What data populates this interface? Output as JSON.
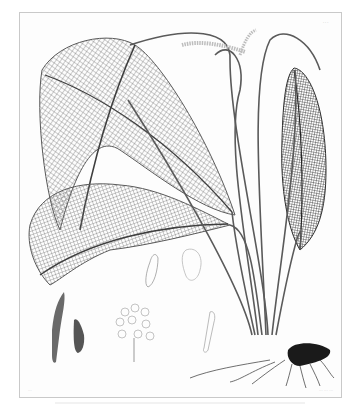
{
  "plate": {
    "type": "botanical engraving",
    "subject": "lattice-leaf aquatic plant with figure details",
    "plate_number": "···",
    "credit_left": "···",
    "credit_right": "··· ··· ···",
    "figures": [
      {
        "id": "leaf-lattice-large",
        "description": "large lattice (fenestrated) leaf, upper left"
      },
      {
        "id": "leaf-lattice-lower",
        "description": "curved lattice leaf, lower left"
      },
      {
        "id": "leaf-dark-right",
        "description": "dark narrow lattice leaf, right"
      },
      {
        "id": "inflorescence",
        "description": "spike inflorescence at top"
      },
      {
        "id": "rhizome",
        "description": "dark rhizome with roots, lower right"
      },
      {
        "id": "fig-spathe",
        "description": "spathe detail, lower left"
      },
      {
        "id": "fig-bract",
        "description": "bract detail, lower left"
      },
      {
        "id": "fig-flowers",
        "description": "flower cluster detail, bottom center"
      },
      {
        "id": "fig-carpel",
        "description": "carpel detail"
      },
      {
        "id": "fig-seed",
        "description": "seed detail"
      },
      {
        "id": "fig-stamen",
        "description": "stamen detail"
      }
    ]
  },
  "colors": {
    "ink": "#4a4a4a",
    "ink_dark": "#1e1e1e",
    "lattice": "#7a7a7a",
    "paper": "#fdfdfd",
    "border": "#c9c9c9"
  }
}
